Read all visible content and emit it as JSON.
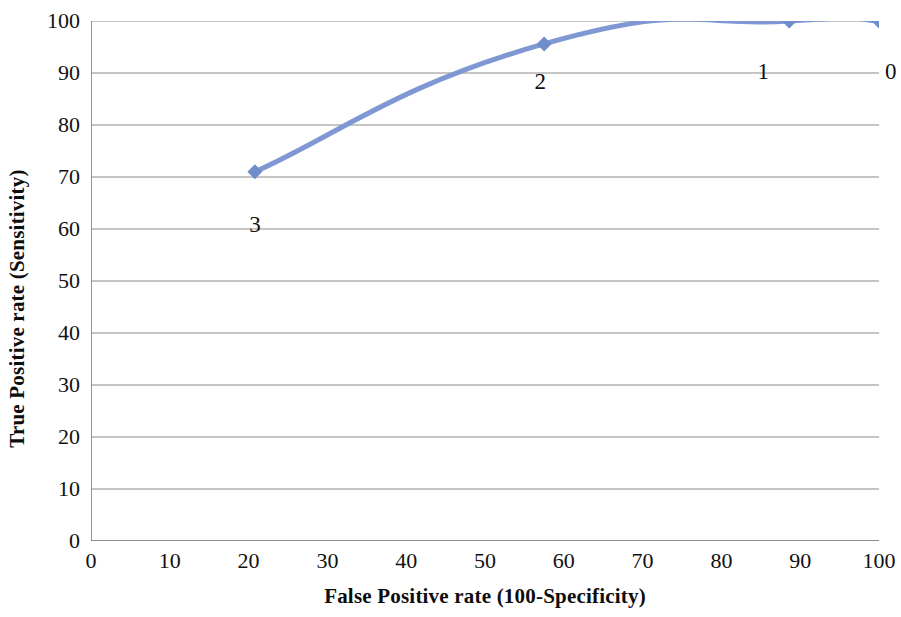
{
  "chart_data": {
    "type": "line",
    "title": "",
    "subtitle": "",
    "xlabel": "False Positive rate (100-Specificity)",
    "ylabel": "True Positive rate (Sensitivity)",
    "xlim": [
      0,
      100
    ],
    "ylim": [
      0,
      100
    ],
    "grid": "horizontal",
    "legend": "none",
    "series": [
      {
        "name": "ROC curve",
        "color": "#7f98d4",
        "marker": "diamond",
        "smooth": true,
        "x": [
          20.8,
          57.5,
          88.6,
          100
        ],
        "y": [
          71.0,
          95.6,
          100.0,
          100.0
        ],
        "point_labels": [
          "3",
          "2",
          "1",
          "0"
        ]
      }
    ],
    "x_ticks": [
      0,
      10,
      20,
      30,
      40,
      50,
      60,
      70,
      80,
      90,
      100
    ],
    "x_tick_labels": [
      "0",
      "10",
      "20",
      "30",
      "40",
      "50",
      "60",
      "70",
      "80",
      "90",
      "100"
    ],
    "y_ticks": [
      0,
      10,
      20,
      30,
      40,
      50,
      60,
      70,
      80,
      90,
      100
    ],
    "y_tick_labels": [
      "0",
      "10",
      "20",
      "30",
      "40",
      "50",
      "60",
      "70",
      "80",
      "90",
      "100"
    ],
    "annotations": [
      {
        "text": "3",
        "x": 20.8,
        "y": 63.0
      },
      {
        "text": "2",
        "x": 57.0,
        "y": 90.5
      },
      {
        "text": "1",
        "x": 85.3,
        "y": 92.5
      },
      {
        "text": "0",
        "x": 101.5,
        "y": 92.5
      }
    ]
  },
  "colors": {
    "series": "#7f98d4",
    "marker": "#6f8ccb",
    "grid": "#8c8c8c",
    "axis": "#7a7a7a",
    "text": "#111111"
  }
}
